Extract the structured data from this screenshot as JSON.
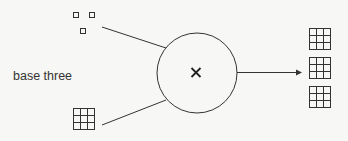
{
  "diagram": {
    "label": "base three",
    "operator": "×",
    "inputs": [
      {
        "name": "three-units",
        "description": "three single unit squares"
      },
      {
        "name": "nine-grid",
        "description": "3x3 grid (nine)"
      }
    ],
    "output": {
      "name": "three-nine-grids",
      "count": 3,
      "description": "three 3x3 grids (twenty-seven)"
    },
    "colors": {
      "stroke": "#333333",
      "background": "#f7f7f5"
    }
  }
}
